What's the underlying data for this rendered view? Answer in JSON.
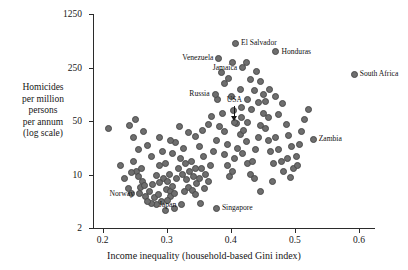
{
  "chart_data": {
    "type": "scatter",
    "title": "",
    "xlabel": "Income inequality (household-based Gini index)",
    "ylabel_lines": [
      "Homicides",
      "per million",
      "persons",
      "per annum",
      "(log scale)"
    ],
    "ylabel": "Homicides per million persons per annum (log scale)",
    "xlim": [
      0.185,
      0.625
    ],
    "ylim": [
      2,
      1250
    ],
    "yscale": "log",
    "xticks": [
      0.2,
      0.3,
      0.4,
      0.5,
      0.6
    ],
    "xtick_labels": [
      "0.2",
      "0.3",
      "0.4",
      "0.5",
      "0.6"
    ],
    "yticks": [
      2,
      10,
      50,
      250,
      1250
    ],
    "ytick_labels": [
      "2",
      "10",
      "50",
      "250",
      "1250"
    ],
    "grid": false,
    "legend": false,
    "marker_color": "#6e6e6e",
    "marker_edge_color": "#4a4a4a",
    "annotations": [
      {
        "label": "Venezuela",
        "x": 0.3815,
        "y": 330,
        "place": "left"
      },
      {
        "label": "El Salvador",
        "x": 0.4075,
        "y": 520,
        "place": "right"
      },
      {
        "label": "Jamaica",
        "x": 0.4185,
        "y": 250,
        "place": "left"
      },
      {
        "label": "Honduras",
        "x": 0.4705,
        "y": 400,
        "place": "right"
      },
      {
        "label": "South Africa",
        "x": 0.5925,
        "y": 205,
        "place": "right"
      },
      {
        "label": "Russia",
        "x": 0.3755,
        "y": 112,
        "place": "left"
      },
      {
        "label": "USA",
        "x": 0.4055,
        "y": 48,
        "place": "leader"
      },
      {
        "label": "Zambia",
        "x": 0.5285,
        "y": 29,
        "place": "right"
      },
      {
        "label": "Norway",
        "x": 0.2575,
        "y": 5.6,
        "place": "left"
      },
      {
        "label": "Japan",
        "x": 0.3235,
        "y": 4.0,
        "place": "left"
      },
      {
        "label": "Singapore",
        "x": 0.3775,
        "y": 3.6,
        "place": "right"
      }
    ],
    "points": [
      {
        "x": 0.2095,
        "y": 40
      },
      {
        "x": 0.2425,
        "y": 44
      },
      {
        "x": 0.2485,
        "y": 30
      },
      {
        "x": 0.2515,
        "y": 52
      },
      {
        "x": 0.2555,
        "y": 21
      },
      {
        "x": 0.2475,
        "y": 15
      },
      {
        "x": 0.2535,
        "y": 11
      },
      {
        "x": 0.2565,
        "y": 9.5
      },
      {
        "x": 0.2605,
        "y": 12
      },
      {
        "x": 0.2615,
        "y": 8.0
      },
      {
        "x": 0.2585,
        "y": 6.8
      },
      {
        "x": 0.2655,
        "y": 7.2
      },
      {
        "x": 0.2275,
        "y": 13
      },
      {
        "x": 0.2345,
        "y": 9.0
      },
      {
        "x": 0.2405,
        "y": 6.5
      },
      {
        "x": 0.2455,
        "y": 5.6
      },
      {
        "x": 0.2665,
        "y": 5.2
      },
      {
        "x": 0.2725,
        "y": 6.0
      },
      {
        "x": 0.2775,
        "y": 7.5
      },
      {
        "x": 0.2805,
        "y": 5.0
      },
      {
        "x": 0.2865,
        "y": 5.4
      },
      {
        "x": 0.2835,
        "y": 9.6
      },
      {
        "x": 0.2895,
        "y": 13
      },
      {
        "x": 0.2755,
        "y": 17
      },
      {
        "x": 0.2705,
        "y": 24
      },
      {
        "x": 0.2645,
        "y": 36
      },
      {
        "x": 0.2885,
        "y": 30
      },
      {
        "x": 0.2935,
        "y": 20
      },
      {
        "x": 0.2975,
        "y": 14
      },
      {
        "x": 0.2945,
        "y": 9.0
      },
      {
        "x": 0.3005,
        "y": 8.2
      },
      {
        "x": 0.3045,
        "y": 10
      },
      {
        "x": 0.2995,
        "y": 6.4
      },
      {
        "x": 0.3055,
        "y": 6.0
      },
      {
        "x": 0.3095,
        "y": 7.0
      },
      {
        "x": 0.3065,
        "y": 5.2
      },
      {
        "x": 0.3125,
        "y": 5.6
      },
      {
        "x": 0.3015,
        "y": 4.6
      },
      {
        "x": 0.2925,
        "y": 4.4
      },
      {
        "x": 0.3155,
        "y": 9.0
      },
      {
        "x": 0.3185,
        "y": 12
      },
      {
        "x": 0.3215,
        "y": 16
      },
      {
        "x": 0.3095,
        "y": 19
      },
      {
        "x": 0.3135,
        "y": 26
      },
      {
        "x": 0.3255,
        "y": 22
      },
      {
        "x": 0.3295,
        "y": 14
      },
      {
        "x": 0.3245,
        "y": 10
      },
      {
        "x": 0.3305,
        "y": 8.5
      },
      {
        "x": 0.3355,
        "y": 11
      },
      {
        "x": 0.3385,
        "y": 15
      },
      {
        "x": 0.3425,
        "y": 9.5
      },
      {
        "x": 0.3345,
        "y": 6.8
      },
      {
        "x": 0.3405,
        "y": 6.2
      },
      {
        "x": 0.3465,
        "y": 7.6
      },
      {
        "x": 0.3445,
        "y": 5.4
      },
      {
        "x": 0.3505,
        "y": 9.0
      },
      {
        "x": 0.3545,
        "y": 12
      },
      {
        "x": 0.3575,
        "y": 17
      },
      {
        "x": 0.3515,
        "y": 23
      },
      {
        "x": 0.3455,
        "y": 31
      },
      {
        "x": 0.3605,
        "y": 10
      },
      {
        "x": 0.3645,
        "y": 8.0
      },
      {
        "x": 0.3595,
        "y": 6.6
      },
      {
        "x": 0.3685,
        "y": 13
      },
      {
        "x": 0.3725,
        "y": 20
      },
      {
        "x": 0.3775,
        "y": 28
      },
      {
        "x": 0.3825,
        "y": 42
      },
      {
        "x": 0.3865,
        "y": 62
      },
      {
        "x": 0.3795,
        "y": 95
      },
      {
        "x": 0.3905,
        "y": 36
      },
      {
        "x": 0.3945,
        "y": 25
      },
      {
        "x": 0.3895,
        "y": 18
      },
      {
        "x": 0.3955,
        "y": 13
      },
      {
        "x": 0.3985,
        "y": 9.5
      },
      {
        "x": 0.4025,
        "y": 11
      },
      {
        "x": 0.4065,
        "y": 16
      },
      {
        "x": 0.4105,
        "y": 22
      },
      {
        "x": 0.4145,
        "y": 33
      },
      {
        "x": 0.4085,
        "y": 46
      },
      {
        "x": 0.4035,
        "y": 68
      },
      {
        "x": 0.4165,
        "y": 55
      },
      {
        "x": 0.4205,
        "y": 38
      },
      {
        "x": 0.4245,
        "y": 27
      },
      {
        "x": 0.4185,
        "y": 19
      },
      {
        "x": 0.4265,
        "y": 14
      },
      {
        "x": 0.4305,
        "y": 10
      },
      {
        "x": 0.4345,
        "y": 15
      },
      {
        "x": 0.4385,
        "y": 21
      },
      {
        "x": 0.4425,
        "y": 30
      },
      {
        "x": 0.4465,
        "y": 44
      },
      {
        "x": 0.4505,
        "y": 62
      },
      {
        "x": 0.4425,
        "y": 88
      },
      {
        "x": 0.4365,
        "y": 125
      },
      {
        "x": 0.4305,
        "y": 175
      },
      {
        "x": 0.4545,
        "y": 40
      },
      {
        "x": 0.4585,
        "y": 28
      },
      {
        "x": 0.4625,
        "y": 20
      },
      {
        "x": 0.4665,
        "y": 14
      },
      {
        "x": 0.4545,
        "y": 90
      },
      {
        "x": 0.4605,
        "y": 130
      },
      {
        "x": 0.4705,
        "y": 30
      },
      {
        "x": 0.4745,
        "y": 21
      },
      {
        "x": 0.4785,
        "y": 15
      },
      {
        "x": 0.4825,
        "y": 11
      },
      {
        "x": 0.4745,
        "y": 60
      },
      {
        "x": 0.4805,
        "y": 85
      },
      {
        "x": 0.4865,
        "y": 45
      },
      {
        "x": 0.4905,
        "y": 32
      },
      {
        "x": 0.4945,
        "y": 23
      },
      {
        "x": 0.4885,
        "y": 16
      },
      {
        "x": 0.4985,
        "y": 12
      },
      {
        "x": 0.5025,
        "y": 17
      },
      {
        "x": 0.5065,
        "y": 25
      },
      {
        "x": 0.5105,
        "y": 36
      },
      {
        "x": 0.5145,
        "y": 52
      },
      {
        "x": 0.5205,
        "y": 70
      },
      {
        "x": 0.4325,
        "y": 70
      },
      {
        "x": 0.4405,
        "y": 225
      },
      {
        "x": 0.4025,
        "y": 290
      },
      {
        "x": 0.3895,
        "y": 155
      },
      {
        "x": 0.4155,
        "y": 130
      },
      {
        "x": 0.4265,
        "y": 95
      },
      {
        "x": 0.3655,
        "y": 45
      },
      {
        "x": 0.3705,
        "y": 58
      },
      {
        "x": 0.3565,
        "y": 38
      },
      {
        "x": 0.3345,
        "y": 35
      },
      {
        "x": 0.3195,
        "y": 42
      },
      {
        "x": 0.3055,
        "y": 28
      },
      {
        "x": 0.2835,
        "y": 4.0
      },
      {
        "x": 0.2765,
        "y": 4.2
      },
      {
        "x": 0.2695,
        "y": 4.4
      },
      {
        "x": 0.3525,
        "y": 4.2
      },
      {
        "x": 0.4645,
        "y": 8.0
      },
      {
        "x": 0.4365,
        "y": 9.0
      },
      {
        "x": 0.4925,
        "y": 9.2
      },
      {
        "x": 0.5045,
        "y": 13
      },
      {
        "x": 0.4465,
        "y": 6.0
      },
      {
        "x": 0.2985,
        "y": 3.4
      },
      {
        "x": 0.3125,
        "y": 3.6
      },
      {
        "x": 0.4585,
        "y": 55
      },
      {
        "x": 0.4705,
        "y": 105
      },
      {
        "x": 0.4265,
        "y": 48
      },
      {
        "x": 0.4505,
        "y": 110
      },
      {
        "x": 0.4005,
        "y": 105
      },
      {
        "x": 0.3965,
        "y": 180
      },
      {
        "x": 0.3855,
        "y": 215
      },
      {
        "x": 0.4245,
        "y": 290
      },
      {
        "x": 0.4465,
        "y": 165
      },
      {
        "x": 0.4165,
        "y": 74
      },
      {
        "x": 0.3455,
        "y": 12
      },
      {
        "x": 0.3285,
        "y": 6.0
      },
      {
        "x": 0.2895,
        "y": 7.8
      },
      {
        "x": 0.2455,
        "y": 10.5
      }
    ]
  }
}
